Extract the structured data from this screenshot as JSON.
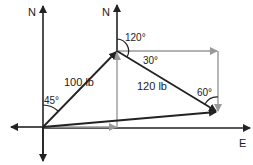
{
  "diagram": {
    "axes": {
      "north_left": "N",
      "north_right": "N",
      "east": "E"
    },
    "vectors": [
      {
        "name": "first-force",
        "label": "100 lb",
        "angle_label": "45°",
        "color": "#222222"
      },
      {
        "name": "second-force",
        "label": "120 lb",
        "angle_label": "120°",
        "color": "#222222"
      },
      {
        "name": "resultant",
        "label": "",
        "color": "#222222"
      }
    ],
    "angles": {
      "a45": "45°",
      "a120": "120°",
      "a30": "30°",
      "a60": "60°"
    },
    "colors": {
      "vector": "#222222",
      "component": "#999999"
    }
  }
}
